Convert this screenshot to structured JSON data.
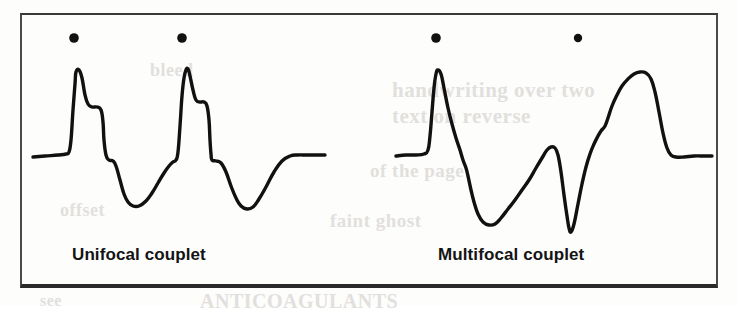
{
  "figure": {
    "type": "ecg-rhythm-strips",
    "background_color": "#fdfdfc",
    "ink_color": "#111111",
    "frame_color": "#3a3a3a"
  },
  "panels": [
    {
      "id": "unifocal",
      "label": "Unifocal couplet",
      "marker_name": "pvc-marker-dot",
      "marker_count": 2,
      "description": "Two identical-morphology premature ventricular complexes in a row"
    },
    {
      "id": "multifocal",
      "label": "Multifocal couplet",
      "marker_name": "pvc-marker-dot",
      "marker_count": 2,
      "description": "Two premature ventricular complexes of differing morphology in a row"
    }
  ],
  "chart_data": {
    "type": "line",
    "title": "",
    "xlabel": "",
    "ylabel": "",
    "grid": false,
    "legend": "none",
    "series": [
      {
        "name": "Unifocal couplet",
        "stroke": "#111111",
        "points": [
          [
            33,
            157
          ],
          [
            45,
            156
          ],
          [
            58,
            155
          ],
          [
            66,
            154
          ],
          [
            69,
            152
          ],
          [
            71,
            140
          ],
          [
            73,
            110
          ],
          [
            75,
            84
          ],
          [
            76,
            72
          ],
          [
            79,
            70
          ],
          [
            82,
            78
          ],
          [
            85,
            95
          ],
          [
            88,
            104
          ],
          [
            92,
            107
          ],
          [
            97,
            107
          ],
          [
            101,
            110
          ],
          [
            103,
            122
          ],
          [
            104,
            140
          ],
          [
            106,
            155
          ],
          [
            109,
            160
          ],
          [
            113,
            161
          ],
          [
            116,
            166
          ],
          [
            120,
            180
          ],
          [
            124,
            194
          ],
          [
            128,
            202
          ],
          [
            133,
            206
          ],
          [
            139,
            206
          ],
          [
            146,
            201
          ],
          [
            152,
            193
          ],
          [
            158,
            183
          ],
          [
            164,
            173
          ],
          [
            169,
            166
          ],
          [
            173,
            162
          ],
          [
            176,
            160
          ],
          [
            178,
            152
          ],
          [
            180,
            126
          ],
          [
            182,
            96
          ],
          [
            184,
            78
          ],
          [
            186,
            70
          ],
          [
            188,
            69
          ],
          [
            190,
            76
          ],
          [
            193,
            90
          ],
          [
            196,
            100
          ],
          [
            200,
            102
          ],
          [
            204,
            102
          ],
          [
            207,
            106
          ],
          [
            209,
            120
          ],
          [
            210,
            140
          ],
          [
            211,
            154
          ],
          [
            212,
            160
          ],
          [
            216,
            161
          ],
          [
            221,
            163
          ],
          [
            226,
            172
          ],
          [
            231,
            186
          ],
          [
            236,
            198
          ],
          [
            241,
            206
          ],
          [
            247,
            209
          ],
          [
            253,
            207
          ],
          [
            259,
            199
          ],
          [
            266,
            187
          ],
          [
            274,
            172
          ],
          [
            282,
            161
          ],
          [
            290,
            156
          ],
          [
            298,
            155
          ],
          [
            306,
            155
          ],
          [
            316,
            155
          ],
          [
            325,
            155
          ]
        ]
      },
      {
        "name": "Multifocal couplet",
        "stroke": "#111111",
        "points": [
          [
            396,
            156
          ],
          [
            406,
            155
          ],
          [
            416,
            155
          ],
          [
            424,
            154
          ],
          [
            428,
            150
          ],
          [
            430,
            136
          ],
          [
            432,
            112
          ],
          [
            434,
            88
          ],
          [
            436,
            74
          ],
          [
            438,
            70
          ],
          [
            441,
            74
          ],
          [
            444,
            88
          ],
          [
            448,
            108
          ],
          [
            452,
            124
          ],
          [
            456,
            138
          ],
          [
            460,
            150
          ],
          [
            463,
            160
          ],
          [
            466,
            168
          ],
          [
            468,
            176
          ],
          [
            471,
            190
          ],
          [
            474,
            202
          ],
          [
            478,
            214
          ],
          [
            483,
            222
          ],
          [
            489,
            225
          ],
          [
            495,
            224
          ],
          [
            501,
            218
          ],
          [
            508,
            209
          ],
          [
            515,
            200
          ],
          [
            522,
            190
          ],
          [
            529,
            180
          ],
          [
            536,
            168
          ],
          [
            542,
            158
          ],
          [
            547,
            150
          ],
          [
            551,
            147
          ],
          [
            555,
            148
          ],
          [
            558,
            155
          ],
          [
            561,
            172
          ],
          [
            564,
            195
          ],
          [
            567,
            216
          ],
          [
            569,
            228
          ],
          [
            571,
            232
          ],
          [
            574,
            224
          ],
          [
            578,
            204
          ],
          [
            582,
            184
          ],
          [
            586,
            167
          ],
          [
            590,
            154
          ],
          [
            594,
            144
          ],
          [
            598,
            136
          ],
          [
            601,
            131
          ],
          [
            605,
            126
          ],
          [
            608,
            118
          ],
          [
            612,
            106
          ],
          [
            617,
            95
          ],
          [
            622,
            86
          ],
          [
            628,
            79
          ],
          [
            634,
            74
          ],
          [
            640,
            72
          ],
          [
            646,
            73
          ],
          [
            651,
            79
          ],
          [
            655,
            92
          ],
          [
            659,
            112
          ],
          [
            663,
            133
          ],
          [
            667,
            148
          ],
          [
            671,
            155
          ],
          [
            676,
            157
          ],
          [
            684,
            157
          ],
          [
            694,
            156
          ],
          [
            704,
            156
          ],
          [
            712,
            156
          ]
        ]
      }
    ],
    "markers": [
      {
        "panel": "unifocal",
        "x": 74,
        "y": 38,
        "r": 4.8
      },
      {
        "panel": "unifocal",
        "x": 182,
        "y": 38,
        "r": 4.8
      },
      {
        "panel": "multifocal",
        "x": 436,
        "y": 38,
        "r": 4.8
      },
      {
        "panel": "multifocal",
        "x": 578,
        "y": 38,
        "r": 4.2
      }
    ]
  },
  "scan_artifacts": {
    "show_through_lines": [
      "handwriting over two",
      "text on reverse",
      "of the page",
      "faint ghost",
      "bleed",
      "offset",
      "ANTICOAGULANTS",
      "see"
    ]
  }
}
